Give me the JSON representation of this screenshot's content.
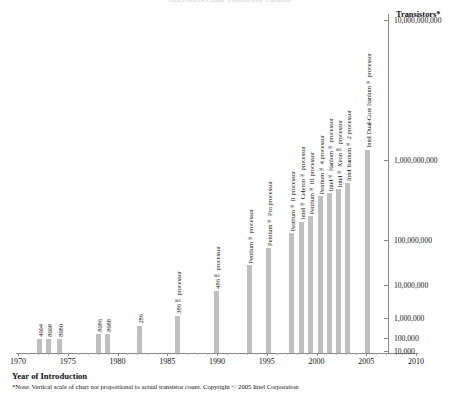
{
  "title_clipped": "Microprocessor Transistor Counts",
  "axes": {
    "x_title": "Year of Introduction",
    "y_title": "Transistors*",
    "x_ticks": [
      1970,
      1975,
      1980,
      1985,
      1990,
      1995,
      2000,
      2005,
      2010
    ],
    "y_ticks": [
      "10,000,000,000",
      "1,000,000,000",
      "100,000,000",
      "10,000,000",
      "1,000,000",
      "100,000",
      "10,000"
    ]
  },
  "footnote": "*Note: Vertical scale of chart not proportional to actual transistor count. Copyright © 2005 Intel Corporation",
  "colors": {
    "bar": "#bfbfbf",
    "axis": "#8a8a8a",
    "text": "#111111",
    "background": "#ffffff"
  },
  "chart_data": {
    "type": "bar",
    "title": "Microprocessor Transistor Counts",
    "xlabel": "Year of Introduction",
    "ylabel": "Transistors*",
    "scale": "log",
    "grid": false,
    "legend": "none",
    "xlim": [
      1970,
      2010
    ],
    "ylim": [
      10000,
      10000000000
    ],
    "ytick_values": [
      10000,
      100000,
      1000000,
      10000000,
      100000000,
      1000000000,
      10000000000
    ],
    "ytick_labels": [
      "10,000",
      "100,000",
      "1,000,000",
      "10,000,000",
      "100,000,000",
      "1,000,000,000",
      "10,000,000,000"
    ],
    "xtick_values": [
      1970,
      1975,
      1980,
      1985,
      1990,
      1995,
      2000,
      2005,
      2010
    ],
    "categories": [
      "4004",
      "8008",
      "8080",
      "8086",
      "8088",
      "286",
      "386™ processor",
      "486™ processor",
      "Pentium® processor",
      "Pentium® Pro processor",
      "Pentium® II processor",
      "Intel® Celeron® processor",
      "Pentium® III processor",
      "Pentium® 4 processor",
      "Intel® Itanium® processor",
      "Intel® Xeon™ processor",
      "Intel Itanium® 2 processor",
      "Intel Dual-Core Itanium® processor"
    ],
    "x": [
      1971,
      1972,
      1974,
      1978,
      1979,
      1982,
      1985,
      1989,
      1993,
      1995,
      1997,
      1998,
      1999,
      2000,
      2001,
      2002,
      2003,
      2005
    ],
    "values": [
      2300,
      3500,
      6000,
      29000,
      29000,
      134000,
      275000,
      1180000,
      3100000,
      5500000,
      7500000,
      9000000,
      28000000,
      42000000,
      25000000,
      55000000,
      220000000,
      1720000000
    ],
    "bars": [
      {
        "label": "4004",
        "year": 1971,
        "bar_px_x": 37,
        "bar_px_height": 14
      },
      {
        "label": "8008",
        "year": 1972,
        "bar_px_x": 46,
        "bar_px_height": 14
      },
      {
        "label": "8080",
        "year": 1974,
        "bar_px_x": 57,
        "bar_px_height": 14
      },
      {
        "label": "8086",
        "year": 1978,
        "bar_px_x": 96,
        "bar_px_height": 19
      },
      {
        "label": "8088",
        "year": 1979,
        "bar_px_x": 105,
        "bar_px_height": 19
      },
      {
        "label": "286",
        "year": 1982,
        "bar_px_x": 137,
        "bar_px_height": 27
      },
      {
        "label": "386™ processor",
        "year": 1985,
        "bar_px_x": 175,
        "bar_px_height": 37
      },
      {
        "label": "486™ processor",
        "year": 1989,
        "bar_px_x": 214,
        "bar_px_height": 62
      },
      {
        "label": "Pentium® processor",
        "year": 1993,
        "bar_px_x": 247,
        "bar_px_height": 88
      },
      {
        "label": "Pentium® Pro processor",
        "year": 1995,
        "bar_px_x": 266,
        "bar_px_height": 105
      },
      {
        "label": "Pentium® II processor",
        "year": 1997,
        "bar_px_x": 289,
        "bar_px_height": 120
      },
      {
        "label": "Intel® Celeron® processor",
        "year": 1998,
        "bar_px_x": 299,
        "bar_px_height": 131
      },
      {
        "label": "Pentium® III processor",
        "year": 1999,
        "bar_px_x": 308,
        "bar_px_height": 137
      },
      {
        "label": "Pentium® 4 processor",
        "year": 2000,
        "bar_px_x": 318,
        "bar_px_height": 157
      },
      {
        "label": "Intel® Itanium® processor",
        "year": 2001,
        "bar_px_x": 327,
        "bar_px_height": 160
      },
      {
        "label": "Intel® Xeon™ processor",
        "year": 2002,
        "bar_px_x": 336,
        "bar_px_height": 164
      },
      {
        "label": "Intel Itanium® 2 processor",
        "year": 2003,
        "bar_px_x": 345,
        "bar_px_height": 170
      },
      {
        "label": "Intel Dual-Core Itanium® processor",
        "year": 2005,
        "bar_px_x": 365,
        "bar_px_height": 203
      }
    ]
  }
}
